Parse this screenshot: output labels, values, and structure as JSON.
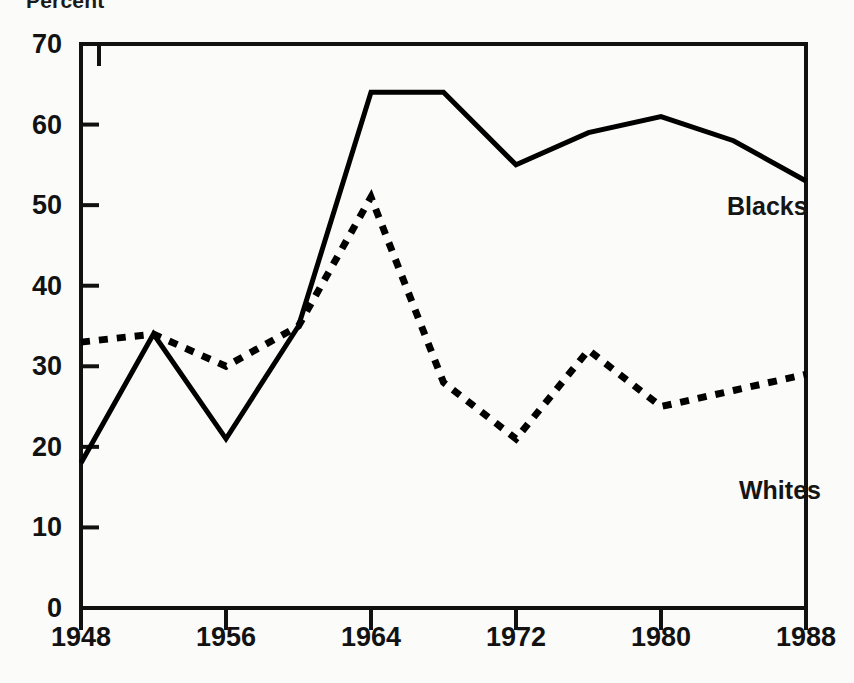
{
  "chart_data": {
    "type": "line",
    "title": "",
    "subtitle": "",
    "xlabel": "",
    "ylabel": "Percent",
    "ylabel_position": "top-left",
    "x": [
      1948,
      1952,
      1956,
      1960,
      1964,
      1968,
      1972,
      1976,
      1980,
      1984,
      1988
    ],
    "xlim": [
      1948,
      1988
    ],
    "ylim": [
      0,
      70
    ],
    "xticks": [
      1948,
      1956,
      1964,
      1972,
      1980,
      1988
    ],
    "xtick_labels": [
      "1948",
      "1956",
      "1964",
      "1972",
      "1980",
      "1988"
    ],
    "yticks": [
      0,
      10,
      20,
      30,
      40,
      50,
      60,
      70
    ],
    "ytick_labels": [
      "0",
      "10",
      "20",
      "30",
      "40",
      "50",
      "60",
      "70"
    ],
    "minor_xticks_interval": 4,
    "grid": false,
    "legend": "inline-annotation",
    "legend_position": "inline",
    "series": [
      {
        "name": "Blacks",
        "style": "solid",
        "color": "#000000",
        "label_x": 1980,
        "label_y": 53,
        "values": [
          18,
          34,
          21,
          35,
          64,
          64,
          55,
          59,
          61,
          58,
          53
        ]
      },
      {
        "name": "Whites",
        "style": "dashed",
        "color": "#000000",
        "label_x": 1981,
        "label_y": 18,
        "values": [
          33,
          34,
          30,
          35,
          51,
          28,
          21,
          32,
          25,
          27,
          29
        ]
      }
    ]
  },
  "axis": {
    "y_label_text": "Percent"
  }
}
